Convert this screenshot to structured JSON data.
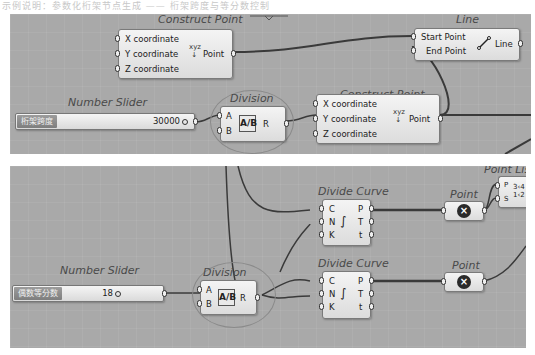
{
  "caption": "示例说明：参数化桁架节点生成 —— 桁架跨度与等分数控制",
  "top": {
    "construct_point_1": {
      "title": "Construct Point",
      "inputs": [
        "X coordinate",
        "Y coordinate",
        "Z coordinate"
      ],
      "output": "Point"
    },
    "line": {
      "title": "Line",
      "inputs": [
        "Start Point",
        "End Point"
      ],
      "output": "Line"
    },
    "slider": {
      "title": "Number Slider",
      "name": "桁架跨度",
      "value": "30000"
    },
    "division": {
      "title": "Division",
      "inputs": [
        "A",
        "B"
      ],
      "output": "R",
      "icon": "A/B"
    },
    "construct_point_2": {
      "title": "Construct Point",
      "inputs": [
        "X coordinate",
        "Y coordinate",
        "Z coordinate"
      ],
      "output": "Point"
    }
  },
  "bottom": {
    "divide_curve_1": {
      "title": "Divide Curve",
      "inputs": [
        "C",
        "N",
        "K"
      ],
      "outputs": [
        "P",
        "T",
        "t"
      ]
    },
    "point_1": {
      "title": "Point"
    },
    "point_list": {
      "title": "Point List",
      "inputs": [
        "P",
        "S"
      ]
    },
    "slider": {
      "title": "Number Slider",
      "name": "偶数等分数",
      "value": "18"
    },
    "division": {
      "title": "Division",
      "inputs": [
        "A",
        "B"
      ],
      "output": "R",
      "icon": "A/B"
    },
    "divide_curve_2": {
      "title": "Divide Curve",
      "inputs": [
        "C",
        "N",
        "K"
      ],
      "outputs": [
        "P",
        "T",
        "t"
      ]
    },
    "point_2": {
      "title": "Point"
    }
  },
  "colors": {
    "canvas": "#a9a9a9",
    "node": "#e8e8e8",
    "wire": "#3a3a3a",
    "highlight": "#8a8a8a"
  }
}
